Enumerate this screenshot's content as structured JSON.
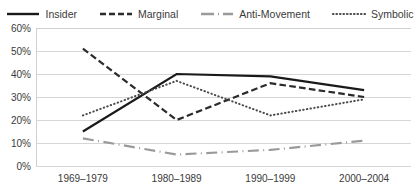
{
  "chart_data": {
    "type": "line",
    "title": "",
    "subtitle": "",
    "xlabel": "",
    "ylabel": "",
    "categories": [
      "1969–1979",
      "1980–1989",
      "1990–1999",
      "2000–2004"
    ],
    "ylim": [
      0,
      60
    ],
    "ytick_values": [
      0,
      10,
      20,
      30,
      40,
      50,
      60
    ],
    "ytick_labels": [
      "0%",
      "10%",
      "20%",
      "30%",
      "40%",
      "50%",
      "60%"
    ],
    "grid": true,
    "grid_axis": "y",
    "legend_position": "top",
    "series": [
      {
        "name": "Insider",
        "values": [
          15,
          40,
          39,
          33
        ],
        "color": "#1a1a1a",
        "style": "solid",
        "width": 2.2
      },
      {
        "name": "Marginal",
        "values": [
          51,
          20,
          36,
          30
        ],
        "color": "#2b2b2b",
        "style": "dashed",
        "width": 2.2
      },
      {
        "name": "Anti-Movement",
        "values": [
          12,
          5,
          7,
          11
        ],
        "color": "#9a9a9a",
        "style": "dashdot",
        "width": 2.2
      },
      {
        "name": "Symbolic",
        "values": [
          22,
          37,
          22,
          29
        ],
        "color": "#4a4a4a",
        "style": "dotted",
        "width": 2.0
      }
    ]
  },
  "legend": {
    "items": [
      {
        "label": "Insider",
        "icon": "solid-line-swatch"
      },
      {
        "label": "Marginal",
        "icon": "dashed-line-swatch"
      },
      {
        "label": "Anti-Movement",
        "icon": "dashdot-line-swatch"
      },
      {
        "label": "Symbolic",
        "icon": "dotted-line-swatch"
      }
    ]
  },
  "colors": {
    "plot_background": "#ffffff",
    "gridline": "#d6d6d6",
    "plot_border": "#d0d0d0",
    "text": "#3a3a3a"
  }
}
